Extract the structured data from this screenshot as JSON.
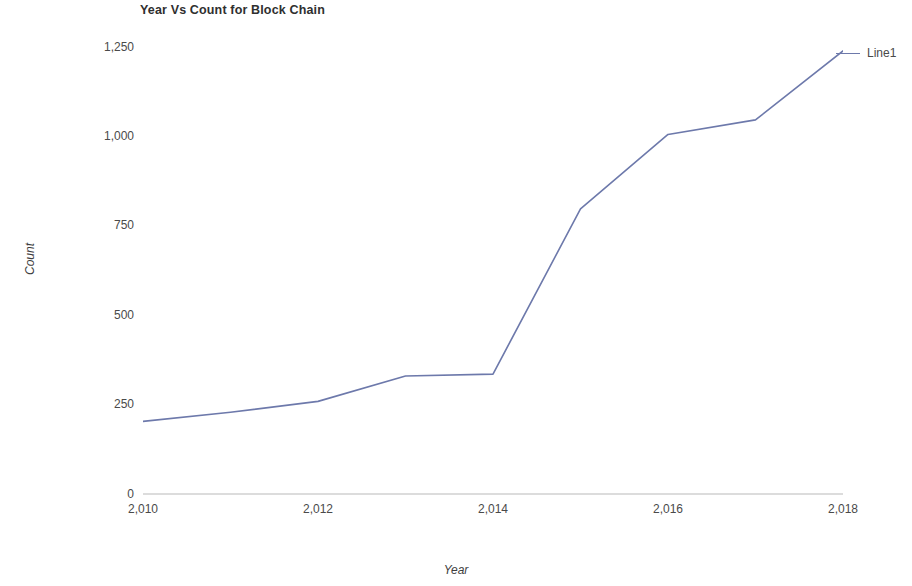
{
  "chart_data": {
    "type": "line",
    "title": "Year Vs Count for Block Chain",
    "xlabel": "Year",
    "ylabel": "Count",
    "x": [
      2010,
      2011,
      2012,
      2013,
      2014,
      2015,
      2016,
      2017,
      2018
    ],
    "series": [
      {
        "name": "Line1",
        "color": "#6d79ab",
        "values": [
          200,
          225,
          255,
          325,
          330,
          785,
          990,
          1030,
          1220
        ]
      }
    ],
    "xlim": [
      2010,
      2018
    ],
    "ylim": [
      0,
      1250
    ],
    "x_ticks": [
      2010,
      2012,
      2014,
      2016,
      2018
    ],
    "x_tick_labels": [
      "2,010",
      "2,012",
      "2,014",
      "2,016",
      "2,018"
    ],
    "y_ticks": [
      0,
      250,
      500,
      750,
      1000,
      1250
    ],
    "y_tick_labels": [
      "0",
      "250",
      "500",
      "750",
      "1,000",
      "1,250"
    ],
    "grid": false,
    "legend_position": "right",
    "legend_entries": [
      "Line1"
    ],
    "axis_color": "#b9b9b9",
    "background": "#ffffff"
  },
  "legend": {
    "line1_label": "Line1"
  },
  "axes": {
    "y_title": "Count",
    "x_title": "Year"
  }
}
